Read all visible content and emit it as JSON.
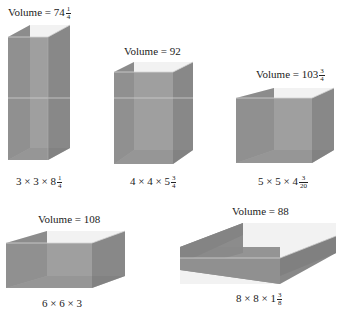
{
  "colors": {
    "front": "#8e8e8e",
    "side": "#7a7a7a",
    "back": "#9a9a9a",
    "floor": "#b4b4b4",
    "edge": "#d0d0d0",
    "top_open": "#f0f0f0"
  },
  "boxes": [
    {
      "volume_label": "Volume = ",
      "volume_whole": "74",
      "volume_num": "1",
      "volume_den": "4",
      "dim_label": "3 × 3 × 8",
      "dim_num": "1",
      "dim_den": "4"
    },
    {
      "volume_label": "Volume = ",
      "volume_whole": "92",
      "volume_num": "",
      "volume_den": "",
      "dim_label": "4 × 4 × 5",
      "dim_num": "3",
      "dim_den": "4"
    },
    {
      "volume_label": "Volume = ",
      "volume_whole": "103",
      "volume_num": "3",
      "volume_den": "4",
      "dim_label": "5 × 5 × 4",
      "dim_num": "3",
      "dim_den": "20"
    },
    {
      "volume_label": "Volume = ",
      "volume_whole": "108",
      "volume_num": "",
      "volume_den": "",
      "dim_label": "6 × 6 × 3",
      "dim_num": "",
      "dim_den": ""
    },
    {
      "volume_label": "Volume = ",
      "volume_whole": "88",
      "volume_num": "",
      "volume_den": "",
      "dim_label": "8 × 8 × 1",
      "dim_num": "3",
      "dim_den": "8"
    }
  ]
}
